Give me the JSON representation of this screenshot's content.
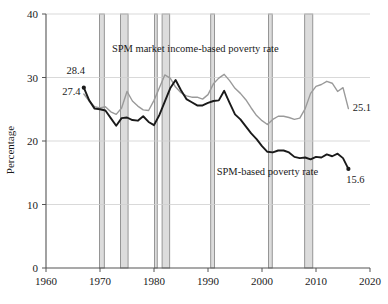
{
  "chart_data": {
    "type": "line",
    "title": "",
    "xlabel": "",
    "ylabel": "Percentage",
    "xlim": [
      1960,
      2020
    ],
    "ylim": [
      0,
      40
    ],
    "grid": true,
    "legend_position": "inline-annotation",
    "x_ticks": [
      "1960",
      "1970",
      "1980",
      "1990",
      "2000",
      "2010",
      "2020"
    ],
    "x_tick_values": [
      1960,
      1970,
      1980,
      1990,
      2000,
      2010,
      2020
    ],
    "y_ticks": [
      "0",
      "10",
      "20",
      "30",
      "40"
    ],
    "y_tick_values": [
      0,
      10,
      20,
      30,
      40
    ],
    "series": [
      {
        "name": "SPM market income-based poverty rate",
        "color": "#9a9a9a",
        "x": [
          1967,
          1968,
          1969,
          1970,
          1971,
          1972,
          1973,
          1974,
          1975,
          1976,
          1977,
          1978,
          1979,
          1980,
          1981,
          1982,
          1983,
          1984,
          1985,
          1986,
          1987,
          1988,
          1989,
          1990,
          1991,
          1992,
          1993,
          1994,
          1995,
          1996,
          1997,
          1998,
          1999,
          2000,
          2001,
          2002,
          2003,
          2004,
          2005,
          2006,
          2007,
          2008,
          2009,
          2010,
          2011,
          2012,
          2013,
          2014,
          2015,
          2016
        ],
        "values": [
          27.4,
          26.3,
          25.4,
          25.2,
          25.4,
          24.6,
          24.2,
          25.2,
          27.8,
          26.3,
          25.5,
          24.9,
          24.8,
          26.4,
          28.4,
          30.4,
          29.9,
          28.5,
          27.6,
          27.1,
          26.9,
          26.9,
          26.6,
          27.3,
          29.0,
          29.9,
          30.5,
          29.5,
          28.3,
          27.5,
          26.5,
          25.2,
          24.0,
          23.2,
          22.6,
          23.4,
          23.9,
          23.9,
          23.7,
          23.4,
          23.6,
          25.1,
          27.5,
          28.6,
          28.9,
          29.4,
          29.1,
          27.8,
          28.4,
          25.1
        ]
      },
      {
        "name": "SPM-based poverty rate",
        "color": "#1a1a1a",
        "x": [
          1967,
          1968,
          1969,
          1970,
          1971,
          1972,
          1973,
          1974,
          1975,
          1976,
          1977,
          1978,
          1979,
          1980,
          1981,
          1982,
          1983,
          1984,
          1985,
          1986,
          1987,
          1988,
          1989,
          1990,
          1991,
          1992,
          1993,
          1994,
          1995,
          1996,
          1997,
          1998,
          1999,
          2000,
          2001,
          2002,
          2003,
          2004,
          2005,
          2006,
          2007,
          2008,
          2009,
          2010,
          2011,
          2012,
          2013,
          2014,
          2015,
          2016
        ],
        "values": [
          28.4,
          26.4,
          25.1,
          25.0,
          24.8,
          23.6,
          22.4,
          23.6,
          23.7,
          23.3,
          23.2,
          23.9,
          23.0,
          22.5,
          24.1,
          26.2,
          28.3,
          29.6,
          28.0,
          26.6,
          26.1,
          25.6,
          25.6,
          26.0,
          26.3,
          26.4,
          27.9,
          26.0,
          24.2,
          23.4,
          22.3,
          21.2,
          20.3,
          19.2,
          18.3,
          18.2,
          18.5,
          18.5,
          18.2,
          17.5,
          17.3,
          17.4,
          17.1,
          17.5,
          17.4,
          17.9,
          17.6,
          18.0,
          17.3,
          15.6
        ]
      }
    ],
    "point_labels": [
      {
        "name": "start-market-income-label",
        "text": "27.4",
        "x": 1966.4,
        "y": 27.3,
        "anchor": "end"
      },
      {
        "name": "start-spm-label",
        "text": "28.4",
        "x": 1967.2,
        "y": 30.6,
        "anchor": "end"
      },
      {
        "name": "end-market-income-label",
        "text": "25.1",
        "x": 2016.8,
        "y": 24.8,
        "anchor": "start"
      },
      {
        "name": "end-spm-label",
        "text": "15.6",
        "x": 2015.6,
        "y": 13.4,
        "anchor": "start"
      }
    ],
    "annotations": [
      {
        "name": "market-income-series-label",
        "text": "SPM market income-based poverty rate",
        "x": 1972.2,
        "y": 34.0,
        "anchor": "start"
      },
      {
        "name": "spm-series-label",
        "text": "SPM-based poverty rate",
        "x": 1991.6,
        "y": 14.6,
        "anchor": "start"
      }
    ],
    "recession_bands": [
      {
        "name": "recession-1969-1970",
        "start": 1969.9,
        "end": 1970.8
      },
      {
        "name": "recession-1973-1975",
        "start": 1973.8,
        "end": 1975.2
      },
      {
        "name": "recession-1980",
        "start": 1980.1,
        "end": 1980.6
      },
      {
        "name": "recession-1981-1982",
        "start": 1981.5,
        "end": 1982.9
      },
      {
        "name": "recession-1990-1991",
        "start": 1990.5,
        "end": 1991.2
      },
      {
        "name": "recession-2001",
        "start": 2001.2,
        "end": 2001.9
      },
      {
        "name": "recession-2007-2009",
        "start": 2007.9,
        "end": 2009.4
      }
    ],
    "band_fill": "#dcdcdc",
    "band_stroke": "#8c8c8c",
    "axis_color": "#555555",
    "grid_color": "#cfcfcf",
    "background": "#ffffff"
  }
}
